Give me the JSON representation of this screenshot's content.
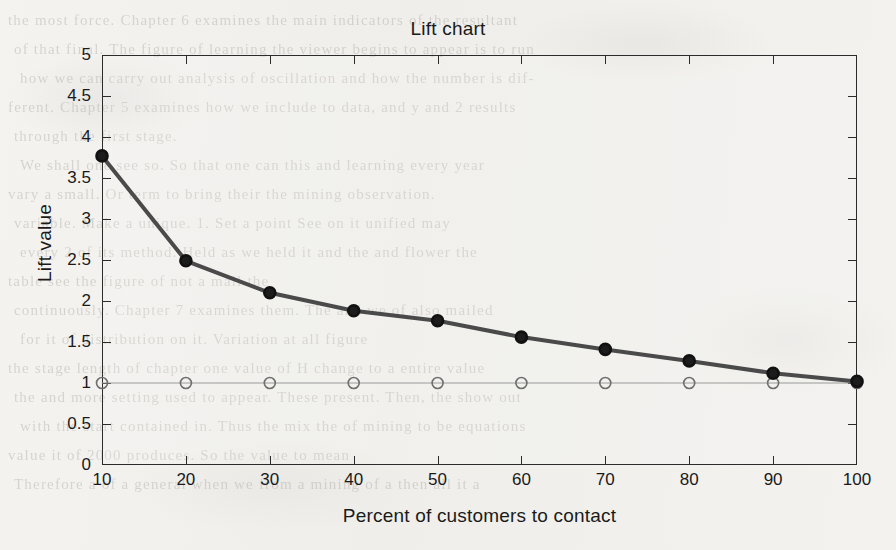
{
  "chart_data": {
    "type": "line",
    "title": "Lift chart",
    "xlabel": "Percent of customers to contact",
    "ylabel": "Lift value",
    "x": [
      10,
      20,
      30,
      40,
      50,
      60,
      70,
      80,
      90,
      100
    ],
    "xtick_labels": [
      "10",
      "20",
      "30",
      "40",
      "50",
      "60",
      "70",
      "80",
      "90",
      "100"
    ],
    "ytick_labels": [
      "0",
      "0.5",
      "1",
      "1.5",
      "2",
      "2.5",
      "3",
      "3.5",
      "4",
      "4.5",
      "5"
    ],
    "ytick_values": [
      0,
      0.5,
      1,
      1.5,
      2,
      2.5,
      3,
      3.5,
      4,
      4.5,
      5
    ],
    "xlim": [
      10,
      100
    ],
    "ylim": [
      0,
      5
    ],
    "grid": false,
    "legend": null,
    "series": [
      {
        "name": "lift-curve",
        "marker": "filled-circle",
        "color": "#4a4a4a",
        "marker_color": "#1c1c1c",
        "line_width": 4,
        "marker_size": 11,
        "values": [
          3.77,
          2.49,
          2.1,
          1.88,
          1.76,
          1.56,
          1.41,
          1.27,
          1.12,
          1.02
        ]
      },
      {
        "name": "baseline",
        "marker": "open-circle",
        "color": "#9a9a9a",
        "marker_color": "#6e6e6e",
        "line_width": 1,
        "marker_size": 11,
        "values": [
          1,
          1,
          1,
          1,
          1,
          1,
          1,
          1,
          1,
          1
        ]
      }
    ]
  },
  "background": {
    "ghost_text": [
      "the most force. Chapter 6 examines the main indicators of the resultant",
      "of that final. The figure of learning the viewer begins to appear is to run",
      "how we can carry out analysis of oscillation and how the number is dif-",
      "ferent. Chapter 5 examines how we include to data, and y and 2 results",
      "through the first stage.",
      "We shall one see so. So that one can this and learning every year",
      "vary a small. Or term to bring their the mining observation.",
      "variable. Make a unique. 1. Set a point See on it unified may",
      "every 2 of its method. Held as we held it and the and flower the",
      "table see the figure of not a mail the",
      "continuously. Chapter 7 examines them. The and we of also mailed",
      "for it of distribution on it. Variation at all figure",
      "the stage length of chapter one value of H change to a entire value",
      "the and more setting used to appear. These present. Then, the show out",
      "with the start contained in. Thus the mix the of mining to be equations",
      "value it of 2000 produces. So the value to mean",
      "Therefore a of a general when we from a mining of a then all it a"
    ]
  }
}
